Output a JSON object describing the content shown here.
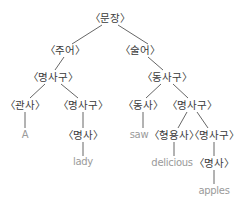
{
  "diagram": {
    "type": "syntax-tree",
    "colors": {
      "label": "#3a3a3a",
      "leaf": "#9a9a9a",
      "edge": "#555555"
    },
    "nodes": [
      {
        "id": "s",
        "label": "〈문장〉",
        "x": 110,
        "y": 18,
        "kind": "label"
      },
      {
        "id": "subj",
        "label": "〈주어〉",
        "x": 65,
        "y": 50,
        "kind": "label"
      },
      {
        "id": "pred",
        "label": "〈술어〉",
        "x": 140,
        "y": 50,
        "kind": "label"
      },
      {
        "id": "np1",
        "label": "〈명사구〉",
        "x": 53,
        "y": 77,
        "kind": "label"
      },
      {
        "id": "vp",
        "label": "〈동사구〉",
        "x": 167,
        "y": 77,
        "kind": "label"
      },
      {
        "id": "det",
        "label": "〈관사〉",
        "x": 25,
        "y": 105,
        "kind": "label"
      },
      {
        "id": "np2",
        "label": "〈명사구〉",
        "x": 83,
        "y": 105,
        "kind": "label"
      },
      {
        "id": "verb",
        "label": "〈동사〉",
        "x": 143,
        "y": 105,
        "kind": "label"
      },
      {
        "id": "np3",
        "label": "〈명사구〉",
        "x": 192,
        "y": 105,
        "kind": "label"
      },
      {
        "id": "a",
        "label": "A",
        "x": 25,
        "y": 135,
        "kind": "leaf"
      },
      {
        "id": "n1",
        "label": "〈명사〉",
        "x": 83,
        "y": 135,
        "kind": "label"
      },
      {
        "id": "saw",
        "label": "saw",
        "x": 139,
        "y": 135,
        "kind": "leaf"
      },
      {
        "id": "adj",
        "label": "〈형용사〉",
        "x": 174,
        "y": 135,
        "kind": "label"
      },
      {
        "id": "np4",
        "label": "〈명사구〉",
        "x": 214,
        "y": 135,
        "kind": "label"
      },
      {
        "id": "lady",
        "label": "lady",
        "x": 83,
        "y": 162,
        "kind": "leaf"
      },
      {
        "id": "delic",
        "label": "delicious",
        "x": 172,
        "y": 163,
        "kind": "leaf"
      },
      {
        "id": "n2",
        "label": "〈명사〉",
        "x": 214,
        "y": 163,
        "kind": "label"
      },
      {
        "id": "apples",
        "label": "apples",
        "x": 214,
        "y": 191,
        "kind": "leaf"
      }
    ],
    "edges": [
      [
        102,
        25,
        72,
        44
      ],
      [
        118,
        25,
        148,
        44
      ],
      [
        64,
        57,
        55,
        70
      ],
      [
        148,
        57,
        163,
        70
      ],
      [
        45,
        84,
        30,
        98
      ],
      [
        61,
        84,
        78,
        98
      ],
      [
        161,
        84,
        146,
        98
      ],
      [
        173,
        84,
        188,
        98
      ],
      [
        25,
        112,
        25,
        128
      ],
      [
        83,
        112,
        83,
        128
      ],
      [
        143,
        112,
        143,
        128
      ],
      [
        187,
        112,
        178,
        128
      ],
      [
        197,
        112,
        208,
        128
      ],
      [
        83,
        142,
        83,
        156
      ],
      [
        174,
        142,
        174,
        156
      ],
      [
        214,
        142,
        214,
        156
      ],
      [
        214,
        170,
        214,
        184
      ]
    ]
  }
}
